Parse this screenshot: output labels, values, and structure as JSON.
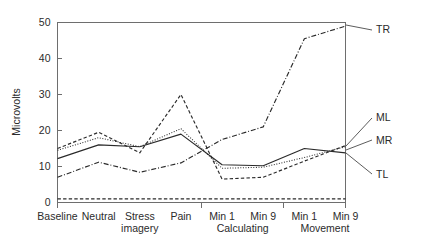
{
  "chart_data": {
    "type": "line",
    "title": "",
    "xlabel": "",
    "ylabel": "Microvolts",
    "ylim": [
      0,
      50
    ],
    "yticks": [
      0,
      10,
      20,
      30,
      40,
      50
    ],
    "grid": false,
    "legend_position": "right-edge-labels",
    "categories": [
      "Baseline",
      "Neutral",
      "Stress imagery",
      "Pain",
      "Min 1",
      "Min 9",
      "Min 1",
      "Min 9"
    ],
    "category_labels": [
      "Baseline",
      "Neutral",
      "Stress",
      "Pain",
      "Min 1",
      "Min 9",
      "Min 1",
      "Min 9"
    ],
    "category_labels_line2": [
      "",
      "",
      "imagery",
      "",
      "",
      "",
      "",
      ""
    ],
    "groups": [
      {
        "label": "Calculating",
        "from": 4,
        "to": 5
      },
      {
        "label": "Movement",
        "from": 6,
        "to": 7
      }
    ],
    "series": [
      {
        "name": "TR",
        "style": "dash-dot",
        "values": [
          7.0,
          11.2,
          8.4,
          11.0,
          17.5,
          21.0,
          45.5,
          49.0
        ]
      },
      {
        "name": "ML",
        "style": "dotted",
        "values": [
          14.5,
          18.0,
          15.5,
          20.5,
          9.5,
          9.8,
          12.5,
          15.5
        ]
      },
      {
        "name": "MR",
        "style": "solid",
        "values": [
          12.2,
          16.0,
          15.5,
          19.0,
          10.5,
          10.2,
          15.0,
          13.8
        ]
      },
      {
        "name": "TL",
        "style": "dashed",
        "values": [
          15.0,
          19.5,
          13.8,
          30.0,
          6.5,
          7.0,
          11.5,
          15.8
        ]
      },
      {
        "name": "baseline-flat",
        "style": "dashed-flat",
        "values": [
          1.0,
          1.0,
          1.0,
          1.0,
          1.0,
          1.0,
          1.0,
          1.0
        ]
      }
    ],
    "series_edge_labels": [
      {
        "name": "TR",
        "label": "TR"
      },
      {
        "name": "ML",
        "label": "ML"
      },
      {
        "name": "MR",
        "label": "MR"
      },
      {
        "name": "TL",
        "label": "TL"
      }
    ]
  },
  "axis": {
    "y_label": "Microvolts",
    "y_tick_labels": [
      "50",
      "40",
      "30",
      "20",
      "10",
      "0"
    ]
  },
  "labels": {
    "tr": "TR",
    "ml": "ML",
    "mr": "MR",
    "tl": "TL"
  }
}
